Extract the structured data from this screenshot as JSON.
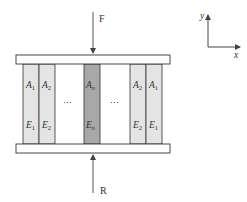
{
  "diagram": {
    "force_top_label": "F",
    "force_bottom_label": "R",
    "axes": {
      "x_label": "x",
      "y_label": "y"
    },
    "ellipsis": "⋯",
    "columns": [
      {
        "area": "A",
        "area_sub": "1",
        "modulus": "E",
        "modulus_sub": "1",
        "fill": "#e4e4e4"
      },
      {
        "area": "A",
        "area_sub": "2",
        "modulus": "E",
        "modulus_sub": "2",
        "fill": "#e4e4e4"
      },
      {
        "area": "A",
        "area_sub": "n",
        "modulus": "E",
        "modulus_sub": "n",
        "fill": "#a8a8a8"
      },
      {
        "area": "A",
        "area_sub": "2",
        "modulus": "E",
        "modulus_sub": "2",
        "fill": "#e4e4e4"
      },
      {
        "area": "A",
        "area_sub": "1",
        "modulus": "E",
        "modulus_sub": "1",
        "fill": "#e4e4e4"
      }
    ],
    "colors": {
      "line": "#333333",
      "plate_fill": "#ffffff",
      "light_bar": "#e4e4e4",
      "dark_bar": "#a8a8a8"
    }
  }
}
